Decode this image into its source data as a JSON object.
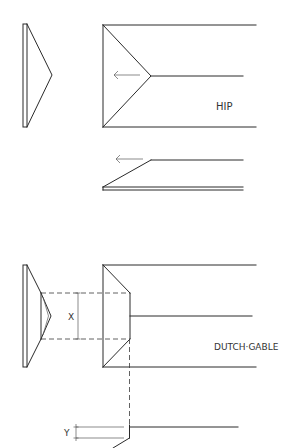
{
  "diagram": {
    "colors": {
      "line": "#2a2a2a",
      "label": "#333333",
      "background": "#ffffff"
    },
    "hip": {
      "label": "HIP",
      "arrow_icon": "left-arrow"
    },
    "dutch_gable": {
      "label": "DUTCH·GABLE",
      "dimension_x": "X",
      "dimension_y": "Y"
    }
  }
}
